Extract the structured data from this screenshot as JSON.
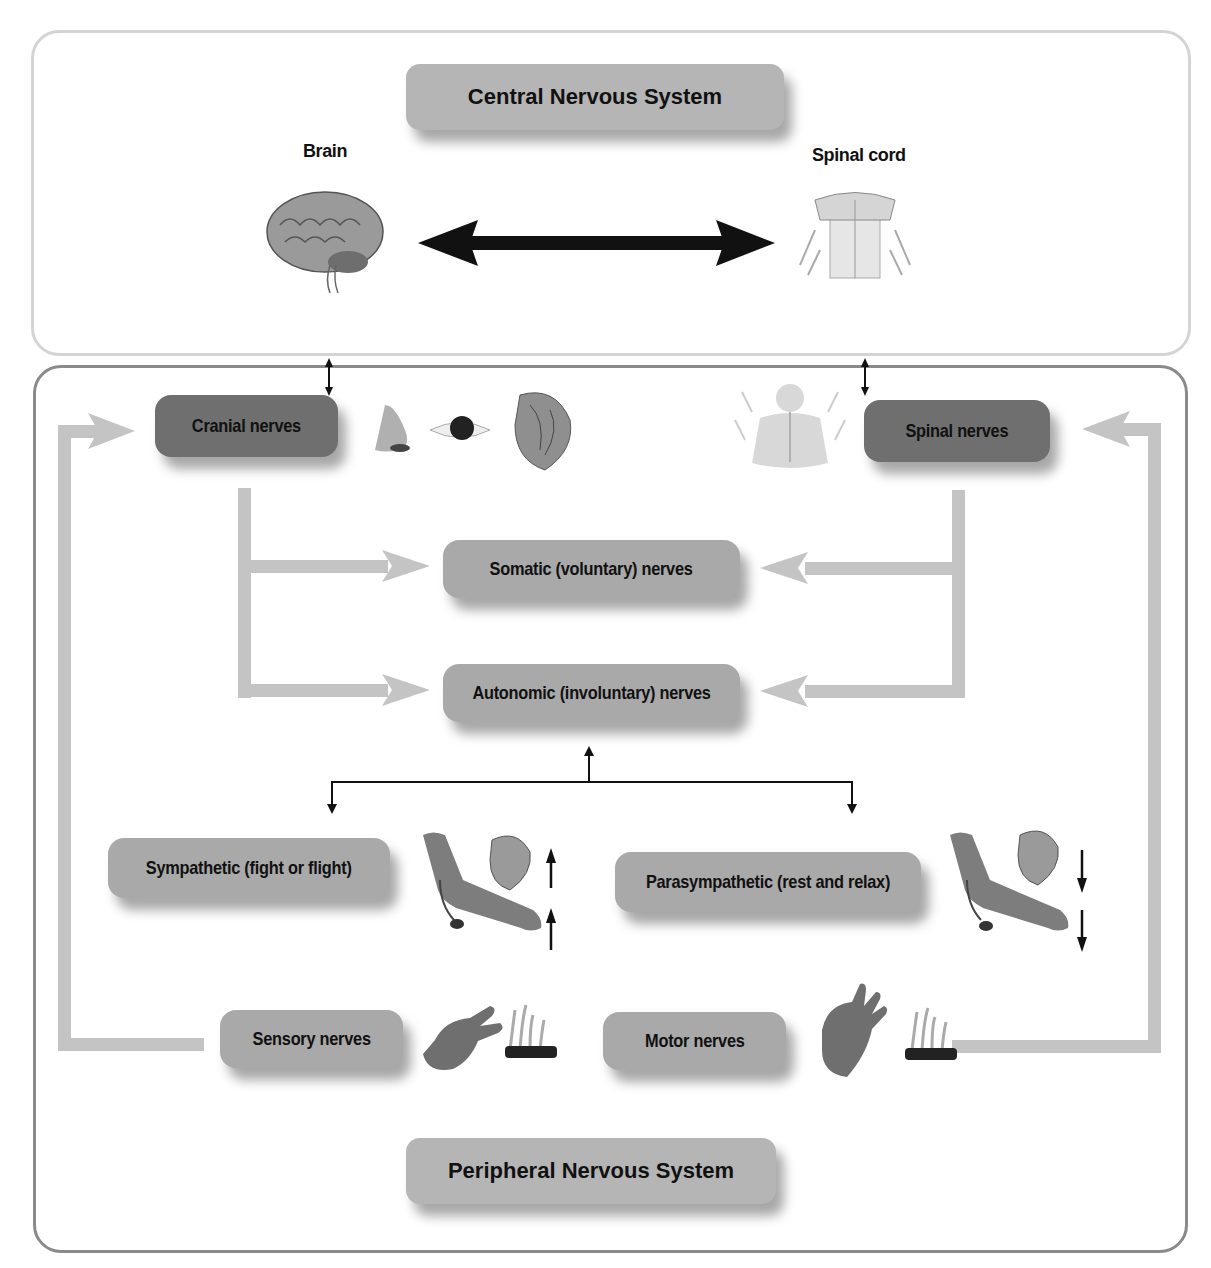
{
  "cns": {
    "title": "Central Nervous System",
    "brain_label": "Brain",
    "spinal_cord_label": "Spinal cord",
    "connection": "bidirectional"
  },
  "pns": {
    "title": "Peripheral Nervous System",
    "cranial_nerves": "Cranial nerves",
    "spinal_nerves": "Spinal nerves",
    "somatic": "Somatic (voluntary) nerves",
    "autonomic": "Autonomic (involuntary) nerves",
    "sympathetic": "Sympathetic (fight or flight)",
    "parasympathetic": "Parasympathetic (rest and relax)",
    "sensory": "Sensory nerves",
    "motor": "Motor nerves"
  },
  "illustrations": {
    "cranial": [
      "nose",
      "eye",
      "heart"
    ],
    "spinal": [
      "torso-with-spinal-nerves"
    ],
    "sympathetic": [
      "arm-with-blood-pressure-cuff",
      "heart",
      "arrow-up",
      "arrow-up"
    ],
    "parasympathetic": [
      "arm-with-blood-pressure-cuff",
      "heart",
      "arrow-down",
      "arrow-down"
    ],
    "sensory": [
      "hand",
      "fire"
    ],
    "motor": [
      "hand",
      "fire"
    ]
  },
  "colors": {
    "cns_border": "#d4d4d4",
    "pns_border": "#8a8a8a",
    "box_light": "#b5b5b5",
    "box_mid": "#a9a9a9",
    "box_dark": "#6f6f6f",
    "flow_arrow": "#c4c4c4",
    "line": "#111111"
  }
}
